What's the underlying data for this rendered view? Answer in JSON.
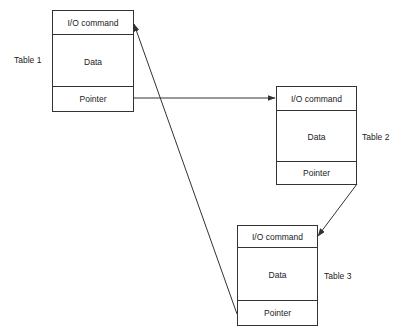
{
  "diagram": {
    "tables": [
      {
        "name": "Table 1",
        "header": "I/O command",
        "body": "Data",
        "footer": "Pointer"
      },
      {
        "name": "Table 2",
        "header": "I/O command",
        "body": "Data",
        "footer": "Pointer"
      },
      {
        "name": "Table 3",
        "header": "I/O command",
        "body": "Data",
        "footer": "Pointer"
      }
    ],
    "connections": [
      {
        "from": "Table 1 Pointer",
        "to": "Table 2 I/O command"
      },
      {
        "from": "Table 2 Pointer",
        "to": "Table 3 I/O command"
      },
      {
        "from": "Table 3 Pointer",
        "to": "Table 1 I/O command"
      }
    ],
    "colors": {
      "line": "#333333",
      "background": "#ffffff"
    }
  }
}
